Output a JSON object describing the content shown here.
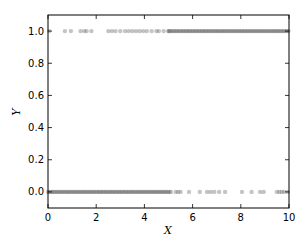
{
  "chart_data": {
    "type": "scatter",
    "title": "",
    "xlabel": "X",
    "ylabel": "Y",
    "xlim": [
      0,
      10
    ],
    "ylim": [
      -0.1,
      1.1
    ],
    "xticks": [
      "0",
      "2",
      "4",
      "6",
      "8",
      "10"
    ],
    "yticks": [
      "0.0",
      "0.2",
      "0.4",
      "0.6",
      "0.8",
      "1.0"
    ],
    "grid": false,
    "legend": null,
    "marker_color": "#555555",
    "marker_alpha": 0.35,
    "series": [
      {
        "name": "y=1",
        "y": 1.0,
        "x_sparse": [
          0.05,
          0.7,
          0.95,
          1.35,
          1.5,
          1.6,
          1.8,
          2.5,
          2.65,
          2.8,
          3.0,
          3.2,
          3.35,
          3.5,
          3.65,
          3.8,
          3.95,
          4.1,
          4.3,
          4.5,
          4.6,
          4.8,
          5.0
        ],
        "x_dense_range": [
          5.0,
          10.0
        ]
      },
      {
        "name": "y=0",
        "y": 0.0,
        "x_dense_range": [
          0.0,
          5.1
        ],
        "x_sparse": [
          5.3,
          5.4,
          5.5,
          5.85,
          6.3,
          6.6,
          6.75,
          6.9,
          7.1,
          7.35,
          8.05,
          8.45,
          8.8,
          8.95,
          9.5,
          9.6,
          9.7,
          9.8,
          9.95
        ]
      }
    ]
  }
}
